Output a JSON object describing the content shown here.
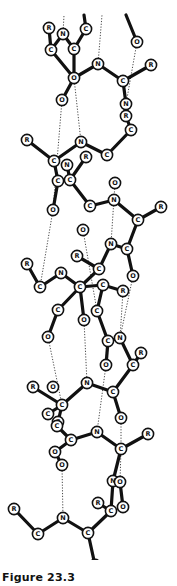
{
  "caption": "Figure 23.3",
  "diagram": {
    "atoms": [
      {
        "id": "a1",
        "label": "R",
        "x": 49,
        "y": 28
      },
      {
        "id": "a2",
        "label": "N",
        "x": 63,
        "y": 34
      },
      {
        "id": "a3",
        "label": "C",
        "x": 86,
        "y": 29
      },
      {
        "id": "a4",
        "label": "C",
        "x": 51,
        "y": 50
      },
      {
        "id": "a5",
        "label": "C",
        "x": 74,
        "y": 49
      },
      {
        "id": "a6",
        "label": "O",
        "x": 137,
        "y": 42
      },
      {
        "id": "a7",
        "label": "N",
        "x": 98,
        "y": 64
      },
      {
        "id": "a8",
        "label": "R",
        "x": 151,
        "y": 65
      },
      {
        "id": "a9",
        "label": "O",
        "x": 74,
        "y": 78
      },
      {
        "id": "a10",
        "label": "C",
        "x": 123,
        "y": 81
      },
      {
        "id": "a11",
        "label": "O",
        "x": 62,
        "y": 100
      },
      {
        "id": "a12",
        "label": "N",
        "x": 126,
        "y": 104
      },
      {
        "id": "a13",
        "label": "R",
        "x": 126,
        "y": 116
      },
      {
        "id": "a14",
        "label": "C",
        "x": 131,
        "y": 130
      },
      {
        "id": "a15",
        "label": "R",
        "x": 27,
        "y": 140
      },
      {
        "id": "a16",
        "label": "N",
        "x": 81,
        "y": 142
      },
      {
        "id": "a17",
        "label": "C",
        "x": 107,
        "y": 155
      },
      {
        "id": "a18",
        "label": "R",
        "x": 86,
        "y": 157
      },
      {
        "id": "a19",
        "label": "C",
        "x": 54,
        "y": 161
      },
      {
        "id": "a20",
        "label": "N",
        "x": 67,
        "y": 165
      },
      {
        "id": "a21",
        "label": "C",
        "x": 58,
        "y": 181
      },
      {
        "id": "a22",
        "label": "C",
        "x": 70,
        "y": 180
      },
      {
        "id": "a23",
        "label": "O",
        "x": 115,
        "y": 183
      },
      {
        "id": "a24",
        "label": "N",
        "x": 114,
        "y": 200
      },
      {
        "id": "a25",
        "label": "R",
        "x": 161,
        "y": 207
      },
      {
        "id": "a26",
        "label": "C",
        "x": 90,
        "y": 206
      },
      {
        "id": "a27",
        "label": "O",
        "x": 53,
        "y": 210
      },
      {
        "id": "a28",
        "label": "C",
        "x": 138,
        "y": 220
      },
      {
        "id": "a29",
        "label": "O",
        "x": 83,
        "y": 230
      },
      {
        "id": "a30",
        "label": "N",
        "x": 111,
        "y": 244
      },
      {
        "id": "a31",
        "label": "C",
        "x": 127,
        "y": 249
      },
      {
        "id": "a32",
        "label": "R",
        "x": 77,
        "y": 256
      },
      {
        "id": "a33",
        "label": "R",
        "x": 27,
        "y": 264
      },
      {
        "id": "a34",
        "label": "C",
        "x": 99,
        "y": 269
      },
      {
        "id": "a35",
        "label": "O",
        "x": 133,
        "y": 276
      },
      {
        "id": "a36",
        "label": "N",
        "x": 61,
        "y": 273
      },
      {
        "id": "a37",
        "label": "C",
        "x": 40,
        "y": 287
      },
      {
        "id": "a38",
        "label": "C",
        "x": 80,
        "y": 287
      },
      {
        "id": "a39",
        "label": "C",
        "x": 103,
        "y": 285
      },
      {
        "id": "a40",
        "label": "R",
        "x": 123,
        "y": 291
      },
      {
        "id": "a41",
        "label": "C",
        "x": 58,
        "y": 310
      },
      {
        "id": "a42",
        "label": "C",
        "x": 97,
        "y": 311
      },
      {
        "id": "a43",
        "label": "O",
        "x": 84,
        "y": 320
      },
      {
        "id": "a44",
        "label": "O",
        "x": 48,
        "y": 337
      },
      {
        "id": "a45",
        "label": "C",
        "x": 108,
        "y": 341
      },
      {
        "id": "a46",
        "label": "N",
        "x": 120,
        "y": 338
      },
      {
        "id": "a47",
        "label": "R",
        "x": 141,
        "y": 353
      },
      {
        "id": "a48",
        "label": "O",
        "x": 106,
        "y": 365
      },
      {
        "id": "a49",
        "label": "C",
        "x": 133,
        "y": 365
      },
      {
        "id": "a50",
        "label": "R",
        "x": 33,
        "y": 387
      },
      {
        "id": "a51",
        "label": "O",
        "x": 53,
        "y": 387
      },
      {
        "id": "a52",
        "label": "N",
        "x": 87,
        "y": 383
      },
      {
        "id": "a53",
        "label": "C",
        "x": 62,
        "y": 405
      },
      {
        "id": "a54",
        "label": "C",
        "x": 113,
        "y": 392
      },
      {
        "id": "a55",
        "label": "C",
        "x": 48,
        "y": 414
      },
      {
        "id": "a56",
        "label": "C",
        "x": 58,
        "y": 422
      },
      {
        "id": "a57",
        "label": "O",
        "x": 121,
        "y": 418
      },
      {
        "id": "a58",
        "label": "C",
        "x": 57,
        "y": 426
      },
      {
        "id": "a59",
        "label": "C",
        "x": 71,
        "y": 440
      },
      {
        "id": "a60",
        "label": "N",
        "x": 97,
        "y": 432
      },
      {
        "id": "a61",
        "label": "R",
        "x": 148,
        "y": 434
      },
      {
        "id": "a62",
        "label": "O",
        "x": 55,
        "y": 452
      },
      {
        "id": "a63",
        "label": "C",
        "x": 121,
        "y": 449
      },
      {
        "id": "a64",
        "label": "O",
        "x": 62,
        "y": 465
      },
      {
        "id": "a65",
        "label": "N",
        "x": 113,
        "y": 481
      },
      {
        "id": "a66",
        "label": "O",
        "x": 120,
        "y": 482
      },
      {
        "id": "a67",
        "label": "R",
        "x": 98,
        "y": 503
      },
      {
        "id": "a68",
        "label": "O",
        "x": 123,
        "y": 507
      },
      {
        "id": "a69",
        "label": "C",
        "x": 111,
        "y": 511
      },
      {
        "id": "a70",
        "label": "R",
        "x": 14,
        "y": 509
      },
      {
        "id": "a71",
        "label": "N",
        "x": 63,
        "y": 518
      },
      {
        "id": "a72",
        "label": "C",
        "x": 88,
        "y": 533
      },
      {
        "id": "a73",
        "label": "C",
        "x": 38,
        "y": 534
      },
      {
        "id": "a74",
        "label": "O",
        "x": 95,
        "y": 565
      }
    ],
    "bonds": [
      [
        "a1",
        "a4"
      ],
      [
        "a2",
        "a4"
      ],
      [
        "a2",
        "a5"
      ],
      [
        "a3",
        "a5"
      ],
      [
        "a5",
        "a9"
      ],
      [
        "a4",
        "a9"
      ],
      [
        "a9",
        "a7"
      ],
      [
        "a9",
        "a11"
      ],
      [
        "a7",
        "a10"
      ],
      [
        "a10",
        "a8"
      ],
      [
        "a10",
        "a12"
      ],
      [
        "a12",
        "a13"
      ],
      [
        "a13",
        "a14"
      ],
      [
        "a14",
        "a17"
      ],
      [
        "a16",
        "a17"
      ],
      [
        "a16",
        "a19"
      ],
      [
        "a15",
        "a19"
      ],
      [
        "a19",
        "a21"
      ],
      [
        "a20",
        "a22"
      ],
      [
        "a18",
        "a22"
      ],
      [
        "a21",
        "a27"
      ],
      [
        "a22",
        "a26"
      ],
      [
        "a26",
        "a24"
      ],
      [
        "a24",
        "a28"
      ],
      [
        "a28",
        "a25"
      ],
      [
        "a28",
        "a31"
      ],
      [
        "a31",
        "a30"
      ],
      [
        "a31",
        "a35"
      ],
      [
        "a30",
        "a34"
      ],
      [
        "a34",
        "a32"
      ],
      [
        "a34",
        "a38"
      ],
      [
        "a33",
        "a37"
      ],
      [
        "a37",
        "a36"
      ],
      [
        "a36",
        "a38"
      ],
      [
        "a38",
        "a41"
      ],
      [
        "a38",
        "a39"
      ],
      [
        "a38",
        "a43"
      ],
      [
        "a39",
        "a40"
      ],
      [
        "a39",
        "a42"
      ],
      [
        "a42",
        "a45"
      ],
      [
        "a45",
        "a48"
      ],
      [
        "a45",
        "a46"
      ],
      [
        "a46",
        "a49"
      ],
      [
        "a49",
        "a47"
      ],
      [
        "a49",
        "a54"
      ],
      [
        "a41",
        "a44"
      ],
      [
        "a54",
        "a52"
      ],
      [
        "a54",
        "a57"
      ],
      [
        "a52",
        "a53"
      ],
      [
        "a50",
        "a53"
      ],
      [
        "a53",
        "a55"
      ],
      [
        "a53",
        "a56"
      ],
      [
        "a56",
        "a58"
      ],
      [
        "a58",
        "a59"
      ],
      [
        "a59",
        "a60"
      ],
      [
        "a60",
        "a63"
      ],
      [
        "a63",
        "a61"
      ],
      [
        "a63",
        "a65"
      ],
      [
        "a65",
        "a69"
      ],
      [
        "a66",
        "a68"
      ],
      [
        "a65",
        "a66"
      ],
      [
        "a69",
        "a67"
      ],
      [
        "a69",
        "a72"
      ],
      [
        "a59",
        "a62"
      ],
      [
        "a62",
        "a64"
      ],
      [
        "a70",
        "a73"
      ],
      [
        "a73",
        "a71"
      ],
      [
        "a71",
        "a72"
      ],
      [
        "a72",
        "a74"
      ]
    ],
    "hbonds": [
      [
        "a2",
        "a2_top"
      ],
      [
        "a7",
        "a7_top"
      ],
      [
        "a6",
        "a12"
      ],
      [
        "a11",
        "a27"
      ],
      [
        "a9",
        "a16"
      ],
      [
        "a23",
        "a30"
      ],
      [
        "a29",
        "a42"
      ],
      [
        "a27",
        "a37"
      ],
      [
        "a35",
        "a46"
      ],
      [
        "a44",
        "a53"
      ],
      [
        "a43",
        "a52"
      ],
      [
        "a40",
        "a46"
      ],
      [
        "a48",
        "a60"
      ],
      [
        "a57",
        "a63"
      ],
      [
        "a64",
        "a71"
      ],
      [
        "a66",
        "a63"
      ]
    ],
    "hbond_stubs": {
      "a2_top": {
        "x": 64,
        "y": 15
      },
      "a7_top": {
        "x": 102,
        "y": 15
      }
    },
    "partial_bonds_top": [
      [
        [
          84,
          15
        ],
        [
          86,
          29
        ]
      ],
      [
        [
          126,
          15
        ],
        [
          137,
          42
        ]
      ]
    ]
  }
}
